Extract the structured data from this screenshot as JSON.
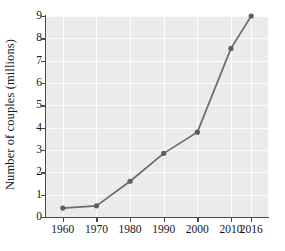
{
  "chart_data": {
    "type": "line",
    "title": "",
    "xlabel": "",
    "ylabel": "Number of couples (millions)",
    "x": [
      1960,
      1970,
      1980,
      1990,
      2000,
      2010,
      2016
    ],
    "values": [
      0.4,
      0.5,
      1.6,
      2.85,
      3.8,
      7.55,
      9.0
    ],
    "xtick_labels": [
      "1960",
      "1970",
      "1980",
      "1990",
      "2000",
      "2010",
      "2016"
    ],
    "ytick_labels": [
      "0",
      "1",
      "2",
      "3",
      "4",
      "5",
      "6",
      "7",
      "8",
      "9"
    ],
    "ylim": [
      0,
      9
    ],
    "xlim": [
      1955,
      2021
    ],
    "grid": true,
    "legend": null,
    "series_color": "#6b6b6b",
    "marker_color": "#5e5e5e",
    "plot_background": "#ebebeb",
    "gridline_color": "#fdfdfd",
    "axis_color": "#4a4a4a"
  },
  "caption": "........ .. ..... .. ..... ......... ... ........"
}
